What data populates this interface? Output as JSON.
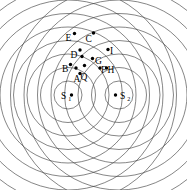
{
  "figure": {
    "background_color": "#ffffff",
    "wavefront_color": "#3a3a3a",
    "marker_color": "#000000",
    "width": 187,
    "height": 190
  },
  "sources": [
    {
      "id": "S1",
      "label": "S",
      "subscript": "1",
      "x": 68,
      "y": 95,
      "dot_x": 71.5,
      "dot_y": 95,
      "label_x": 61,
      "label_y": 98.5,
      "sub_x": 68.2,
      "sub_y": 100.6
    },
    {
      "id": "S2",
      "label": "S",
      "subscript": "2",
      "x": 119,
      "y": 95,
      "dot_x": 115.5,
      "dot_y": 95,
      "label_x": 120,
      "label_y": 98.5,
      "sub_x": 127.2,
      "sub_y": 100.6
    }
  ],
  "wavefronts": {
    "radii": [
      14,
      27.5,
      41,
      54.5,
      68,
      81.5,
      95,
      108.5
    ],
    "count_per_source": 8,
    "description": "Concentric circular wavefronts of equal spacing emitted from each of the two sources"
  },
  "points": [
    {
      "id": "A",
      "label": "A",
      "dot_x": 80.0,
      "dot_y": 73.5,
      "label_x": 73.5,
      "label_y": 81.5
    },
    {
      "id": "B",
      "label": "B",
      "dot_x": 70.5,
      "dot_y": 64.5,
      "label_x": 62.0,
      "label_y": 72.0
    },
    {
      "id": "C",
      "label": "C",
      "dot_x": 93.5,
      "dot_y": 33.0,
      "label_x": 85.5,
      "label_y": 41.5
    },
    {
      "id": "D",
      "label": "D",
      "dot_x": 80.0,
      "dot_y": 50.0,
      "label_x": 70.5,
      "label_y": 57.5
    },
    {
      "id": "E",
      "label": "E",
      "dot_x": 74.5,
      "dot_y": 33.5,
      "label_x": 65.5,
      "label_y": 41.0
    },
    {
      "id": "F",
      "label": "F",
      "dot_x": 100.0,
      "dot_y": 68.0,
      "label_x": 101.0,
      "label_y": 72.5
    },
    {
      "id": "G",
      "label": "G",
      "dot_x": 92.5,
      "dot_y": 58.5,
      "label_x": 95.0,
      "label_y": 63.5
    },
    {
      "id": "H",
      "label": "H",
      "dot_x": 106.5,
      "dot_y": 68.0,
      "label_x": 107.5,
      "label_y": 72.5
    },
    {
      "id": "I",
      "label": "I",
      "dot_x": 108.0,
      "dot_y": 49.5,
      "label_x": 110.0,
      "label_y": 54.0
    },
    {
      "id": "Q",
      "label": "Q",
      "dot_x": 84.5,
      "dot_y": 65.5,
      "label_x": 80.5,
      "label_y": 79.5
    },
    {
      "id": "J1",
      "label": "",
      "dot_x": 82.0,
      "dot_y": 56.5,
      "label_x": 0,
      "label_y": 0
    },
    {
      "id": "J2",
      "label": "",
      "dot_x": 76.0,
      "dot_y": 68.0,
      "label_x": 0,
      "label_y": 0
    }
  ]
}
